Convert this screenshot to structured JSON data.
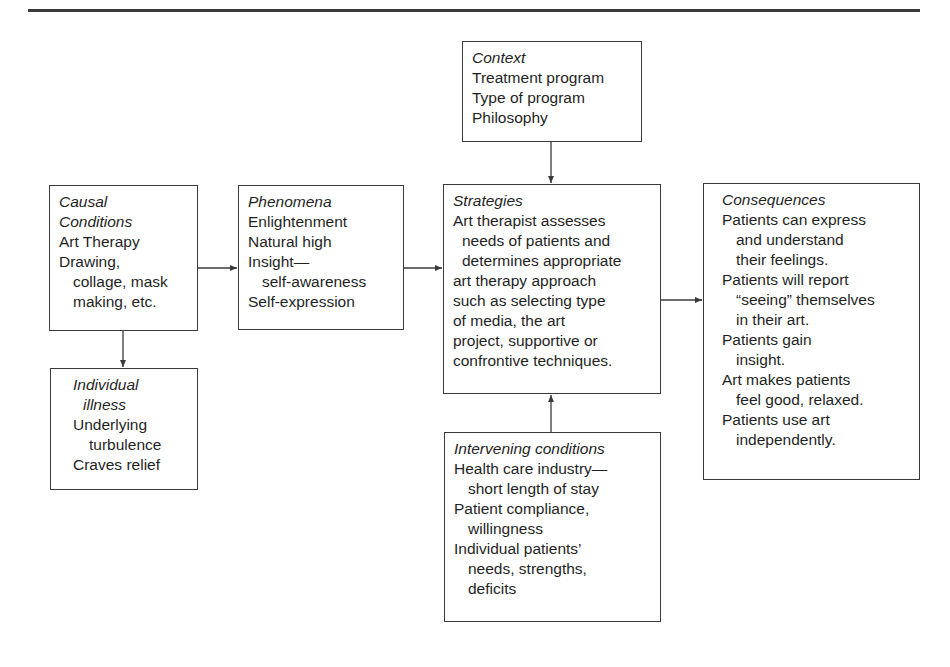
{
  "diagram": {
    "type": "paradigm-model-flow",
    "boxes": {
      "context": {
        "title": "Context",
        "lines": [
          "Treatment program",
          "Type of program",
          "Philosophy"
        ]
      },
      "causal": {
        "title_lines": [
          "Causal",
          "Conditions"
        ],
        "lines": [
          "Art Therapy",
          "Drawing,",
          "collage, mask",
          "making, etc."
        ]
      },
      "individual": {
        "title_lines": [
          "Individual",
          "illness"
        ],
        "lines": [
          "Underlying",
          "turbulence",
          "Craves relief"
        ]
      },
      "phenomena": {
        "title": "Phenomena",
        "lines": [
          "Enlightenment",
          "Natural high",
          "Insight—",
          "self-awareness",
          "Self-expression"
        ]
      },
      "strategies": {
        "title": "Strategies",
        "lines": [
          "Art therapist assesses",
          "needs of patients and",
          "determines appropriate",
          "art therapy approach",
          "such as selecting type",
          "of media, the art",
          "project, supportive or",
          "confrontive techniques."
        ]
      },
      "intervening": {
        "title": "Intervening conditions",
        "lines": [
          "Health care industry—",
          "short length of stay",
          "Patient compliance,",
          "willingness",
          "Individual patients’",
          "needs, strengths,",
          "deficits"
        ]
      },
      "consequences": {
        "title": "Consequences",
        "lines": [
          "Patients can express",
          "and understand",
          "their feelings.",
          "Patients will report",
          "“seeing” themselves",
          "in their art.",
          "Patients gain",
          "insight.",
          "Art makes patients",
          "feel good, relaxed.",
          "Patients use art",
          "independently."
        ]
      }
    },
    "edges": [
      {
        "from": "context",
        "to": "strategies"
      },
      {
        "from": "causal",
        "to": "phenomena"
      },
      {
        "from": "causal",
        "to": "individual"
      },
      {
        "from": "phenomena",
        "to": "strategies"
      },
      {
        "from": "intervening",
        "to": "strategies"
      },
      {
        "from": "strategies",
        "to": "consequences"
      }
    ],
    "colors": {
      "stroke": "#3a3a3a",
      "text": "#1f1f1f",
      "background": "#ffffff"
    }
  }
}
